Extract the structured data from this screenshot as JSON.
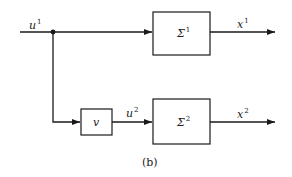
{
  "diagram": {
    "caption": "(b)",
    "input": {
      "name": "u",
      "sup": "1"
    },
    "branch_point": "junction",
    "blocks": [
      {
        "id": "sigma1",
        "name": "Σ",
        "sup": "1"
      },
      {
        "id": "v",
        "name": "v",
        "sup": ""
      },
      {
        "id": "sigma2",
        "name": "Σ",
        "sup": "2"
      }
    ],
    "signals": [
      {
        "id": "u1",
        "name": "u",
        "sup": "1"
      },
      {
        "id": "u2",
        "name": "u",
        "sup": "2"
      },
      {
        "id": "x1",
        "name": "x",
        "sup": "1"
      },
      {
        "id": "x2",
        "name": "x",
        "sup": "2"
      }
    ],
    "colors": {
      "stroke": "#1a1a1a",
      "background": "#ffffff"
    }
  }
}
